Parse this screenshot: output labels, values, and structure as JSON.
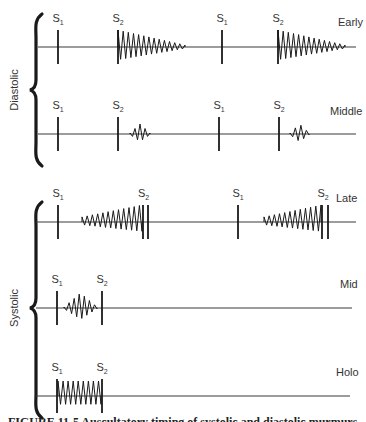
{
  "figure": {
    "groups": [
      {
        "name": "Diastolic",
        "brace": {
          "x": 36,
          "top": 14,
          "bottom": 166,
          "tip_y": 90
        },
        "rows": [
          {
            "label": "Early",
            "label_pos": [
              338,
              26
            ],
            "baseline_y": 47,
            "x_start": 38,
            "x_end": 356,
            "cycles": [
              {
                "s1_x": 58,
                "s2_x": 118,
                "murmur": {
                  "type": "decrescendo",
                  "start": 118,
                  "end": 185,
                  "amp": 17
                }
              },
              {
                "s1_x": 222,
                "s2_x": 278,
                "murmur": {
                  "type": "decrescendo",
                  "start": 278,
                  "end": 345,
                  "amp": 17
                }
              }
            ]
          },
          {
            "label": "Middle",
            "label_pos": [
              330,
              115
            ],
            "baseline_y": 134,
            "x_start": 38,
            "x_end": 356,
            "cycles": [
              {
                "s1_x": 58,
                "s2_x": 118,
                "murmur": {
                  "type": "diamond",
                  "start": 130,
                  "end": 150,
                  "amp": 9
                }
              },
              {
                "s1_x": 219,
                "s2_x": 279,
                "murmur": {
                  "type": "diamond",
                  "start": 290,
                  "end": 309,
                  "amp": 9
                }
              }
            ]
          }
        ]
      },
      {
        "name": "Systolic",
        "brace": {
          "x": 36,
          "top": 202,
          "bottom": 418,
          "tip_y": 308
        },
        "rows": [
          {
            "label": "Late",
            "label_pos": [
              336,
              202
            ],
            "baseline_y": 222,
            "x_start": 36,
            "x_end": 356,
            "cycles": [
              {
                "s1_x": 58,
                "s2_x": 143,
                "s2b_x": 148,
                "murmur": {
                  "type": "crescendo",
                  "start": 82,
                  "end": 142,
                  "amp": 17
                }
              },
              {
                "s1_x": 238,
                "s2_x": 322,
                "s2b_x": 328,
                "murmur": {
                  "type": "crescendo",
                  "start": 264,
                  "end": 321,
                  "amp": 17
                }
              }
            ]
          },
          {
            "label": "Mid",
            "label_pos": [
              340,
              288
            ],
            "baseline_y": 308,
            "x_start": 36,
            "x_end": 352,
            "cycles": [
              {
                "s1_x": 57,
                "s2_x": 102,
                "murmur": {
                  "type": "diamond",
                  "start": 64,
                  "end": 97,
                  "amp": 14
                }
              }
            ]
          },
          {
            "label": "Holo",
            "label_pos": [
              336,
              376
            ],
            "baseline_y": 396,
            "x_start": 36,
            "x_end": 350,
            "cycles": [
              {
                "s1_x": 57,
                "s2_x": 102,
                "murmur": {
                  "type": "plateau",
                  "start": 58,
                  "end": 101,
                  "amp": 15
                }
              }
            ]
          }
        ]
      }
    ],
    "heart_sound_labels": {
      "s1": "S",
      "s1_sub": "1",
      "s2": "S",
      "s2_sub": "2"
    },
    "caption": "FIGURE 11-5 Auscultatory timing of systolic and diastolic murmurs"
  },
  "colors": {
    "ink": "#1a1a1a",
    "baseline": "#3a3a3a",
    "label": "#333333",
    "background": "#ffffff"
  }
}
